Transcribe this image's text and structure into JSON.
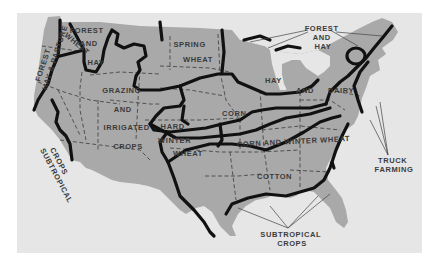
{
  "map": {
    "title": "Agricultural regions of the United States",
    "colors": {
      "background": "#ffffff",
      "panel": "#e6e6e6",
      "land": "#a9a9a9",
      "zone_border": "#111111",
      "label": "#3a3a3a"
    },
    "regions": [
      {
        "id": "forest-hay-pasture-west",
        "lines": [
          "FOREST",
          "HAY & PASTURE"
        ]
      },
      {
        "id": "forest-and-hay-northwest",
        "lines": [
          "FOREST",
          "AND",
          "HAY"
        ]
      },
      {
        "id": "wheat-northwest",
        "lines": [
          "WHEAT"
        ]
      },
      {
        "id": "spring-wheat",
        "lines": [
          "SPRING",
          "WHEAT"
        ]
      },
      {
        "id": "grazing-irrigated",
        "lines": [
          "GRAZING",
          "AND",
          "IRRIGATED",
          "CROPS"
        ]
      },
      {
        "id": "subtropical-west",
        "lines": [
          "SUBTROPICAL",
          "CROPS"
        ]
      },
      {
        "id": "hay-and-dairy",
        "lines": [
          "HAY",
          "AND",
          "DAIRY"
        ]
      },
      {
        "id": "corn",
        "lines": [
          "CORN"
        ]
      },
      {
        "id": "hard-winter-wheat",
        "lines": [
          "HARD",
          "WINTER",
          "WHEAT"
        ]
      },
      {
        "id": "corn-and-winter-wheat",
        "lines": [
          "CORN AND WINTER WHEAT"
        ]
      },
      {
        "id": "cotton",
        "lines": [
          "COTTON"
        ]
      }
    ],
    "callouts": [
      {
        "id": "forest-and-hay-northeast",
        "lines": [
          "FOREST",
          "AND",
          "HAY"
        ]
      },
      {
        "id": "truck-farming",
        "lines": [
          "TRUCK",
          "FARMING"
        ]
      },
      {
        "id": "subtropical-south",
        "lines": [
          "SUBTROPICAL",
          "CROPS"
        ]
      }
    ]
  }
}
